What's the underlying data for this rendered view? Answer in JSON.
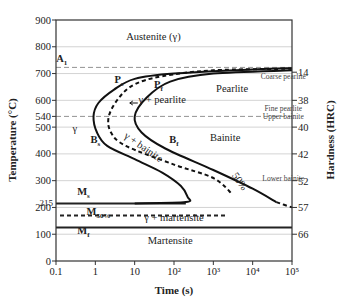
{
  "chart_data": {
    "type": "line",
    "xlabel": "Time (s)",
    "ylabel": "Temperature (°C)",
    "y2label": "Hardness (HRC)",
    "xscale": "log",
    "xlim": [
      0.1,
      100000
    ],
    "ylim": [
      0,
      900
    ],
    "x_ticks": [
      "0.1",
      "1",
      "10",
      "10²",
      "10³",
      "10⁴",
      "10⁵"
    ],
    "y_ticks": [
      0,
      100,
      200,
      300,
      400,
      500,
      540,
      600,
      700,
      800,
      900
    ],
    "y_tick_labels": [
      "0",
      "100",
      "200",
      "300",
      "400",
      "500",
      "540",
      "600",
      "700",
      "800",
      "900"
    ],
    "extra_y_tick": {
      "value": 215,
      "label": "215"
    },
    "hardness_ticks": [
      {
        "temp": 705,
        "label": "14"
      },
      {
        "temp": 600,
        "label": "38"
      },
      {
        "temp": 500,
        "label": "40"
      },
      {
        "temp": 400,
        "label": "42"
      },
      {
        "temp": 300,
        "label": "52"
      },
      {
        "temp": 200,
        "label": "57"
      },
      {
        "temp": 100,
        "label": "66"
      }
    ],
    "reference_lines": [
      {
        "name": "A1",
        "temp": 723,
        "style": "dashed"
      },
      {
        "name": "nose",
        "temp": 540,
        "style": "dashed"
      },
      {
        "name": "Ms",
        "temp": 215,
        "style": "solid"
      },
      {
        "name": "M50%",
        "temp": 170,
        "style": "dotted"
      },
      {
        "name": "Mf",
        "temp": 125,
        "style": "solid"
      }
    ],
    "series": [
      {
        "name": "Start (Ps/Bs)",
        "style": "solid",
        "points": [
          [
            100000,
            720
          ],
          [
            10000,
            715
          ],
          [
            100,
            700
          ],
          [
            10,
            680
          ],
          [
            3,
            640
          ],
          [
            1.2,
            590
          ],
          [
            0.9,
            540
          ],
          [
            1.1,
            480
          ],
          [
            2,
            430
          ],
          [
            10,
            380
          ],
          [
            50,
            330
          ],
          [
            150,
            280
          ],
          [
            220,
            240
          ],
          [
            200,
            220
          ],
          [
            10,
            215
          ]
        ]
      },
      {
        "name": "50% transformation",
        "style": "dashed",
        "points": [
          [
            100000,
            718
          ],
          [
            1000,
            712
          ],
          [
            50,
            690
          ],
          [
            10,
            660
          ],
          [
            4,
            610
          ],
          [
            2.2,
            540
          ],
          [
            2.5,
            480
          ],
          [
            6,
            430
          ],
          [
            100,
            360
          ],
          [
            1000,
            310
          ],
          [
            3000,
            250
          ]
        ]
      },
      {
        "name": "Finish (Pf/Bf)",
        "style": "solid",
        "points": [
          [
            100000,
            712
          ],
          [
            1000,
            700
          ],
          [
            80,
            670
          ],
          [
            20,
            610
          ],
          [
            10,
            540
          ],
          [
            15,
            480
          ],
          [
            60,
            420
          ],
          [
            1000,
            340
          ],
          [
            10000,
            270
          ],
          [
            40000,
            220
          ]
        ]
      },
      {
        "name": "Finish extrapolated",
        "style": "dashed",
        "points": [
          [
            40000,
            220
          ],
          [
            100000,
            200
          ]
        ]
      }
    ],
    "annotations": [
      {
        "text": "Austenite (γ)",
        "x": 30,
        "y": 825
      },
      {
        "text": "A",
        "sub": "1",
        "x": 0.14,
        "y": 745,
        "bold": true
      },
      {
        "text": "P",
        "sub": "s",
        "x": 4,
        "y": 665,
        "bold": true
      },
      {
        "text": "P",
        "sub": "f",
        "x": 40,
        "y": 645,
        "bold": true
      },
      {
        "text": "Pearlite",
        "x": 3000,
        "y": 630
      },
      {
        "text": "γ + pearlite",
        "x": 50,
        "y": 590
      },
      {
        "text": "Coarse pearlite",
        "x": 60000,
        "y": 680,
        "small": true
      },
      {
        "text": "Fine pearlite",
        "x": 60000,
        "y": 560,
        "small": true
      },
      {
        "text": "Upper bainite",
        "x": 60000,
        "y": 530,
        "small": true
      },
      {
        "text": "γ",
        "x": 0.3,
        "y": 480
      },
      {
        "text": "B",
        "sub": "s",
        "x": 1,
        "y": 440,
        "bold": true
      },
      {
        "text": "γ + bainite",
        "x": 15,
        "y": 415,
        "rotate": 35
      },
      {
        "text": "B",
        "sub": "f",
        "x": 100,
        "y": 440,
        "bold": true
      },
      {
        "text": "Bainite",
        "x": 2000,
        "y": 450
      },
      {
        "text": "50%",
        "x": 4000,
        "y": 290,
        "rotate": 55
      },
      {
        "text": "Lower bainite",
        "x": 60000,
        "y": 300,
        "small": true
      },
      {
        "text": "M",
        "sub": "s",
        "x": 0.5,
        "y": 245,
        "bold": true
      },
      {
        "text": "M",
        "sub": "50%",
        "x": 1.2,
        "y": 170,
        "bold": true
      },
      {
        "text": "γ + martensite",
        "x": 100,
        "y": 150
      },
      {
        "text": "M",
        "sub": "f",
        "x": 0.5,
        "y": 100,
        "bold": true
      },
      {
        "text": "Martensite",
        "x": 80,
        "y": 65
      }
    ]
  },
  "labels": {
    "xlabel": "Time (s)",
    "ylabel": "Temperature (°C)",
    "y2label": "Hardness (HRC)"
  }
}
